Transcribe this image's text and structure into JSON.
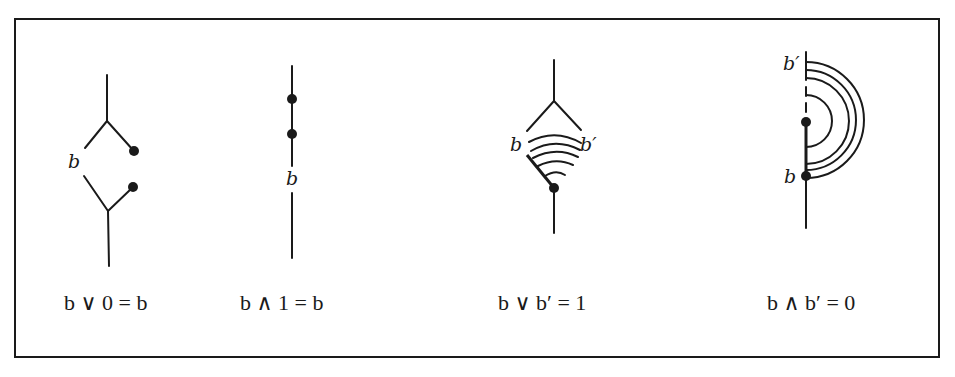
{
  "figure": {
    "panels": [
      {
        "id": "join-zero",
        "node_labels": [
          "b"
        ],
        "caption": "b ∨ 0 = b"
      },
      {
        "id": "meet-one",
        "node_labels": [
          "b"
        ],
        "caption": "b ∧ 1 = b"
      },
      {
        "id": "join-complement",
        "node_labels": [
          "b",
          "b′"
        ],
        "caption": "b ∨ b′ = 1"
      },
      {
        "id": "meet-complement",
        "node_labels": [
          "b′",
          "b"
        ],
        "caption": "b ∧ b′ = 0"
      }
    ],
    "colors": {
      "ink": "#1a1a1a",
      "background": "#ffffff"
    }
  }
}
